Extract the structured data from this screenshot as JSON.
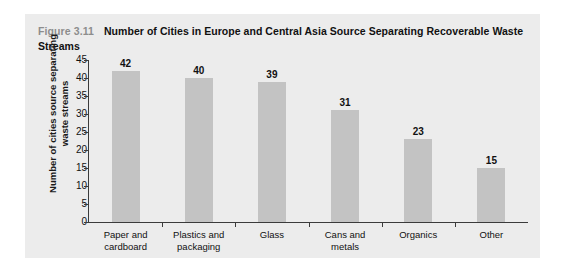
{
  "figure": {
    "number_label": "Figure 3.11",
    "title": "Number of Cities in Europe and Central Asia Source Separating Recoverable Waste Streams"
  },
  "colors": {
    "panel_background": "#ececec",
    "bar_fill": "#c3c3c3",
    "axis": "#3b3b3b",
    "figure_number_text": "#8d8d8d",
    "title_text": "#111111"
  },
  "chart_data": {
    "type": "bar",
    "title": "Number of Cities in Europe and Central Asia Source Separating Recoverable Waste Streams",
    "subtitle": "Figure 3.11",
    "xlabel": "",
    "ylabel": "Number of cities source separating waste streams",
    "categories": [
      "Paper and cardboard",
      "Plastics and packaging",
      "Glass",
      "Cans and metals",
      "Organics",
      "Other"
    ],
    "category_lines": [
      [
        "Paper and",
        "cardboard"
      ],
      [
        "Plastics and",
        "packaging"
      ],
      [
        "Glass",
        ""
      ],
      [
        "Cans and",
        "metals"
      ],
      [
        "Organics",
        ""
      ],
      [
        "Other",
        ""
      ]
    ],
    "values": [
      42,
      40,
      39,
      31,
      23,
      15
    ],
    "value_labels": [
      "42",
      "40",
      "39",
      "31",
      "23",
      "15"
    ],
    "ylim": [
      0,
      45
    ],
    "ytick_values": [
      45,
      40,
      35,
      30,
      25,
      20,
      15,
      10,
      5,
      0
    ],
    "ytick_labels": [
      "45",
      "40",
      "35",
      "30",
      "25",
      "20",
      "15",
      "10",
      "5",
      "0"
    ],
    "grid": false,
    "legend": null
  }
}
